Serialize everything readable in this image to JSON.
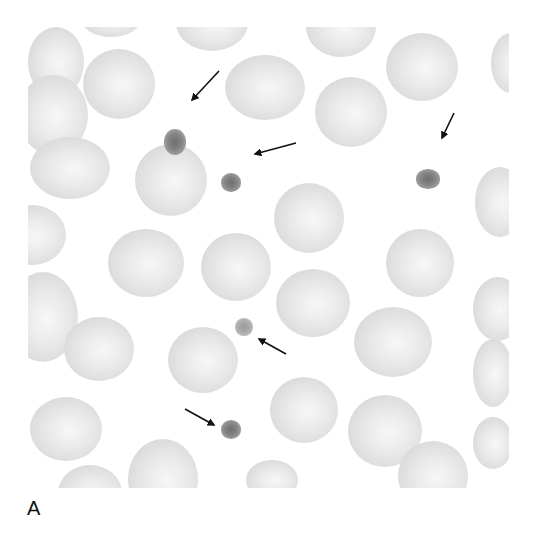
{
  "figure": {
    "panel_label": "A",
    "colors": {
      "background": "#ffffff",
      "cell": "#dcdcdc",
      "platelet": "#7a7a7a",
      "arrow": "#111111"
    }
  },
  "cells": [
    {
      "x": 0,
      "y": 0,
      "w": 56,
      "h": 70
    },
    {
      "x": -10,
      "y": 48,
      "w": 70,
      "h": 80
    },
    {
      "x": 52,
      "y": -30,
      "w": 62,
      "h": 40
    },
    {
      "x": 55,
      "y": 22,
      "w": 72,
      "h": 70
    },
    {
      "x": 148,
      "y": -32,
      "w": 72,
      "h": 56
    },
    {
      "x": 197,
      "y": 28,
      "w": 80,
      "h": 65
    },
    {
      "x": 278,
      "y": -30,
      "w": 70,
      "h": 60
    },
    {
      "x": 287,
      "y": 50,
      "w": 72,
      "h": 70
    },
    {
      "x": 358,
      "y": 6,
      "w": 72,
      "h": 68
    },
    {
      "x": 463,
      "y": 6,
      "w": 40,
      "h": 60
    },
    {
      "x": 2,
      "y": 110,
      "w": 80,
      "h": 62
    },
    {
      "x": 107,
      "y": 117,
      "w": 72,
      "h": 72
    },
    {
      "x": -30,
      "y": 178,
      "w": 68,
      "h": 60
    },
    {
      "x": 246,
      "y": 156,
      "w": 70,
      "h": 70
    },
    {
      "x": 447,
      "y": 140,
      "w": 50,
      "h": 70
    },
    {
      "x": 80,
      "y": 202,
      "w": 76,
      "h": 68
    },
    {
      "x": 173,
      "y": 206,
      "w": 70,
      "h": 68
    },
    {
      "x": 358,
      "y": 202,
      "w": 68,
      "h": 68
    },
    {
      "x": -20,
      "y": 245,
      "w": 70,
      "h": 90
    },
    {
      "x": 248,
      "y": 242,
      "w": 74,
      "h": 68
    },
    {
      "x": 445,
      "y": 250,
      "w": 50,
      "h": 64
    },
    {
      "x": 36,
      "y": 290,
      "w": 70,
      "h": 64
    },
    {
      "x": 140,
      "y": 300,
      "w": 70,
      "h": 66
    },
    {
      "x": 326,
      "y": 280,
      "w": 78,
      "h": 70
    },
    {
      "x": 445,
      "y": 312,
      "w": 40,
      "h": 68
    },
    {
      "x": 2,
      "y": 370,
      "w": 72,
      "h": 64
    },
    {
      "x": 242,
      "y": 350,
      "w": 68,
      "h": 66
    },
    {
      "x": 320,
      "y": 368,
      "w": 74,
      "h": 72
    },
    {
      "x": 445,
      "y": 390,
      "w": 40,
      "h": 52
    },
    {
      "x": 30,
      "y": 438,
      "w": 64,
      "h": 56
    },
    {
      "x": 100,
      "y": 412,
      "w": 70,
      "h": 80
    },
    {
      "x": 218,
      "y": 433,
      "w": 52,
      "h": 40
    },
    {
      "x": 370,
      "y": 414,
      "w": 70,
      "h": 70
    }
  ],
  "platelets": [
    {
      "x": 136,
      "y": 102,
      "w": 22,
      "h": 26,
      "light": false
    },
    {
      "x": 193,
      "y": 146,
      "w": 20,
      "h": 19,
      "light": false
    },
    {
      "x": 388,
      "y": 142,
      "w": 24,
      "h": 20,
      "light": false
    },
    {
      "x": 207,
      "y": 291,
      "w": 18,
      "h": 18,
      "light": true
    },
    {
      "x": 193,
      "y": 393,
      "w": 20,
      "h": 19,
      "light": false
    }
  ],
  "arrows": [
    {
      "x1": 219,
      "y1": 71,
      "x2": 192,
      "y2": 100
    },
    {
      "x1": 296,
      "y1": 143,
      "x2": 255,
      "y2": 154
    },
    {
      "x1": 454,
      "y1": 113,
      "x2": 442,
      "y2": 138
    },
    {
      "x1": 286,
      "y1": 354,
      "x2": 259,
      "y2": 339
    },
    {
      "x1": 185,
      "y1": 409,
      "x2": 214,
      "y2": 425
    }
  ]
}
